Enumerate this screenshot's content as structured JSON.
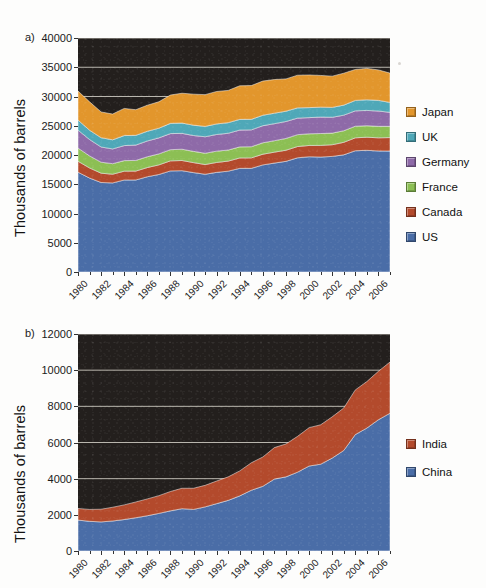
{
  "figure": {
    "background_color": "#fdfdfc",
    "plot_background_color": "#231f1d",
    "gridline_color": "#b9b6ae"
  },
  "panel_a": {
    "letter": "a)",
    "ylabel": "Thousands of barrels",
    "yticks": [
      "0",
      "5000",
      "10000",
      "15000",
      "20000",
      "25000",
      "30000",
      "35000",
      "40000"
    ],
    "xticks": [
      "1980",
      "1982",
      "1984",
      "1986",
      "1988",
      "1990",
      "1992",
      "1994",
      "1996",
      "1998",
      "2000",
      "2002",
      "2004",
      "2006"
    ],
    "legend": [
      {
        "label": "Japan",
        "color": "#e2962c"
      },
      {
        "label": "UK",
        "color": "#4fa8b8"
      },
      {
        "label": "Germany",
        "color": "#8e6aa8"
      },
      {
        "label": "France",
        "color": "#8cbf54"
      },
      {
        "label": "Canada",
        "color": "#b34a2c"
      },
      {
        "label": "US",
        "color": "#4a6da7"
      }
    ]
  },
  "panel_b": {
    "letter": "b)",
    "ylabel": "Thousands of barrels",
    "yticks": [
      "0",
      "2000",
      "4000",
      "6000",
      "8000",
      "10000",
      "12000"
    ],
    "xticks": [
      "1980",
      "1982",
      "1984",
      "1986",
      "1988",
      "1990",
      "1992",
      "1994",
      "1996",
      "1998",
      "2000",
      "2002",
      "2004",
      "2006"
    ],
    "legend": [
      {
        "label": "India",
        "color": "#b34a2c"
      },
      {
        "label": "China",
        "color": "#4a6da7"
      }
    ]
  },
  "chart_data": [
    {
      "id": "panel-a",
      "type": "area",
      "stacked": true,
      "title": "",
      "xlabel": "",
      "ylabel": "Thousands of barrels",
      "ylim": [
        0,
        40000
      ],
      "ytick_step": 5000,
      "grid": true,
      "legend_position": "right",
      "x": [
        1980,
        1981,
        1982,
        1983,
        1984,
        1985,
        1986,
        1987,
        1988,
        1989,
        1990,
        1991,
        1992,
        1993,
        1994,
        1995,
        1996,
        1997,
        1998,
        1999,
        2000,
        2001,
        2002,
        2003,
        2004,
        2005,
        2006,
        2007
      ],
      "series": [
        {
          "name": "US",
          "color": "#4a6da7",
          "values": [
            17060,
            16060,
            15300,
            15230,
            15730,
            15730,
            16280,
            16670,
            17280,
            17320,
            16990,
            16710,
            17030,
            17240,
            17720,
            17720,
            18310,
            18620,
            18920,
            19520,
            19700,
            19650,
            19760,
            20030,
            20730,
            20800,
            20690,
            20680
          ]
        },
        {
          "name": "Canada",
          "color": "#b34a2c",
          "values": [
            1870,
            1730,
            1590,
            1490,
            1510,
            1520,
            1580,
            1640,
            1720,
            1740,
            1710,
            1660,
            1700,
            1720,
            1780,
            1790,
            1830,
            1870,
            1900,
            1930,
            1930,
            1990,
            2000,
            2140,
            2210,
            2240,
            2250,
            2300
          ]
        },
        {
          "name": "France",
          "color": "#8cbf54",
          "values": [
            2260,
            2060,
            1880,
            1800,
            1800,
            1820,
            1840,
            1880,
            1910,
            1930,
            1920,
            1930,
            1930,
            1890,
            1890,
            1910,
            1950,
            1960,
            2010,
            2030,
            2000,
            2030,
            1980,
            1980,
            1980,
            1960,
            1960,
            1920
          ]
        },
        {
          "name": "Germany",
          "color": "#8e6aa8",
          "values": [
            3060,
            2800,
            2600,
            2520,
            2570,
            2630,
            2700,
            2740,
            2750,
            2710,
            2710,
            2820,
            2850,
            2870,
            2880,
            2880,
            2920,
            2910,
            2900,
            2830,
            2760,
            2810,
            2710,
            2660,
            2630,
            2620,
            2620,
            2390
          ]
        },
        {
          "name": "UK",
          "color": "#4fa8b8",
          "values": [
            1730,
            1590,
            1590,
            1560,
            1710,
            1660,
            1660,
            1650,
            1750,
            1760,
            1770,
            1770,
            1800,
            1810,
            1820,
            1800,
            1790,
            1790,
            1760,
            1750,
            1710,
            1700,
            1690,
            1720,
            1780,
            1820,
            1820,
            1700
          ]
        },
        {
          "name": "Japan",
          "color": "#e2962c",
          "values": [
            4960,
            4850,
            4400,
            4400,
            4640,
            4380,
            4450,
            4520,
            4840,
            5100,
            5300,
            5430,
            5550,
            5510,
            5740,
            5770,
            5840,
            5750,
            5520,
            5580,
            5580,
            5420,
            5340,
            5450,
            5290,
            5360,
            5200,
            5010
          ]
        }
      ]
    },
    {
      "id": "panel-b",
      "type": "area",
      "stacked": true,
      "title": "",
      "xlabel": "",
      "ylabel": "Thousands of barrels",
      "ylim": [
        0,
        12000
      ],
      "ytick_step": 2000,
      "grid": true,
      "legend_position": "right",
      "x": [
        1980,
        1981,
        1982,
        1983,
        1984,
        1985,
        1986,
        1987,
        1988,
        1989,
        1990,
        1991,
        1992,
        1993,
        1994,
        1995,
        1996,
        1997,
        1998,
        1999,
        2000,
        2001,
        2002,
        2003,
        2004,
        2005,
        2006,
        2007
      ],
      "series": [
        {
          "name": "China",
          "color": "#4a6da7",
          "values": [
            1710,
            1640,
            1610,
            1660,
            1740,
            1840,
            1950,
            2080,
            2220,
            2340,
            2300,
            2440,
            2620,
            2800,
            3050,
            3360,
            3580,
            3980,
            4100,
            4360,
            4700,
            4800,
            5140,
            5560,
            6440,
            6800,
            7260,
            7620
          ]
        },
        {
          "name": "India",
          "color": "#b34a2c",
          "values": [
            640,
            660,
            700,
            760,
            810,
            870,
            930,
            980,
            1070,
            1130,
            1170,
            1190,
            1250,
            1300,
            1380,
            1520,
            1620,
            1740,
            1820,
            1980,
            2120,
            2180,
            2280,
            2350,
            2470,
            2570,
            2680,
            2830
          ]
        }
      ]
    }
  ]
}
